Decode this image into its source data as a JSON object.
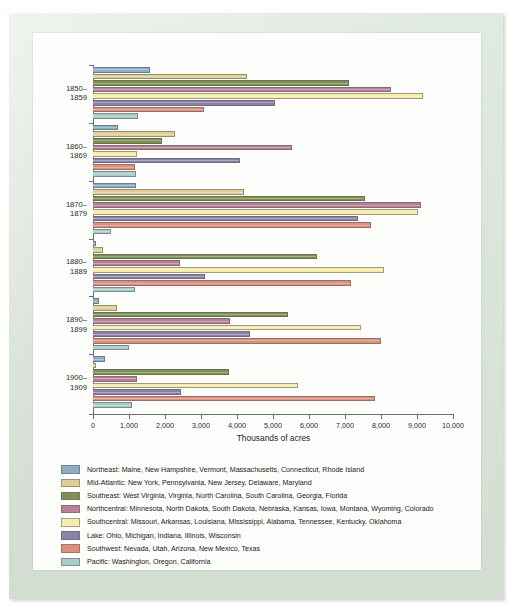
{
  "chart_data": {
    "type": "bar",
    "orientation": "horizontal",
    "title": "",
    "xlabel": "Thousands of acres",
    "ylabel": "",
    "xlim": [
      0,
      10000
    ],
    "xticks": [
      0,
      1000,
      2000,
      3000,
      4000,
      5000,
      6000,
      7000,
      8000,
      9000,
      10000
    ],
    "xtick_labels": [
      "0",
      "1,000",
      "2,000",
      "3,000",
      "4,000",
      "5,000",
      "6,000",
      "7,000",
      "8,000",
      "9,000",
      "10,000"
    ],
    "grid": false,
    "legend_position": "below",
    "categories": [
      "1850–\n1859",
      "1860–\n1869",
      "1870–\n1879",
      "1880–\n1889",
      "1890–\n1899",
      "1900–\n1909"
    ],
    "category_labels": [
      [
        "1850–",
        "1859"
      ],
      [
        "1860–",
        "1869"
      ],
      [
        "1870–",
        "1879"
      ],
      [
        "1880–",
        "1889"
      ],
      [
        "1890–",
        "1899"
      ],
      [
        "1900–",
        "1909"
      ]
    ],
    "series": [
      {
        "name": "Northeast",
        "label": "Northeast: Maine, New Hampshire, Vermont, Massachusetts, Connecticut, Rhode Island",
        "color": "#8aaec4",
        "values": [
          1580,
          690,
          1200,
          90,
          170,
          330
        ]
      },
      {
        "name": "Mid-Atlantic",
        "label": "Mid-Atlantic: New York, Pennsylvania, New Jersey, Delaware, Maryland",
        "color": "#e0cf94",
        "values": [
          4280,
          2270,
          4190,
          280,
          670,
          90
        ]
      },
      {
        "name": "Southeast",
        "label": "Southeast: West Virginia, Virginia, North Carolina, South Carolina, Georgia, Florida",
        "color": "#7d9150",
        "values": [
          7110,
          1920,
          7560,
          6210,
          5420,
          3780
        ]
      },
      {
        "name": "Northcentral",
        "label": "Northcentral: Minnesota, North Dakota, South Dakota, Nebraska, Kansas, Iowa, Montana, Wyoming, Colorado",
        "color": "#b98095",
        "values": [
          8280,
          5530,
          9110,
          2420,
          3800,
          1230
        ]
      },
      {
        "name": "Southcentral",
        "label": "Southcentral: Missouri, Arkansas, Louisiana, Mississippi, Alabama, Tennessee, Kentucky, Oklahoma",
        "color": "#f7ecab",
        "values": [
          9170,
          1230,
          9030,
          8080,
          7440,
          5690
        ]
      },
      {
        "name": "Lake",
        "label": "Lake: Ohio, Michigan, Indiana, Illinois, Wisconsin",
        "color": "#8c82a8",
        "values": [
          5060,
          4080,
          7360,
          3120,
          4350,
          2450
        ]
      },
      {
        "name": "Southwest",
        "label": "Southwest: Nevada, Utah, Arizona, New Mexico, Texas",
        "color": "#dd8f7d",
        "values": [
          3080,
          1170,
          7720,
          7170,
          8000,
          7820
        ]
      },
      {
        "name": "Pacific",
        "label": "Pacific: Washington, Oregon, California",
        "color": "#a8ccc8",
        "values": [
          1250,
          1190,
          490,
          1170,
          1000,
          1080
        ]
      }
    ]
  }
}
